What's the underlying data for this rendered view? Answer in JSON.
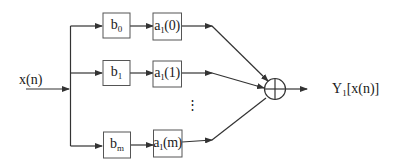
{
  "diagram": {
    "type": "block-diagram",
    "input": {
      "label": "x(n)"
    },
    "output": {
      "label_main": "Y",
      "label_sub": "1",
      "label_rest": "[x(n)]",
      "label": "Y1[x(n)]"
    },
    "branches": [
      {
        "b_main": "b",
        "b_sub": "0",
        "a_main": "a",
        "a_sub": "1",
        "a_arg": "(0)",
        "b_label": "b0",
        "a_label": "a1(0)"
      },
      {
        "b_main": "b",
        "b_sub": "1",
        "a_main": "a",
        "a_sub": "1",
        "a_arg": "(1)",
        "b_label": "b1",
        "a_label": "a1(1)"
      },
      {
        "b_main": "b",
        "b_sub": "m",
        "a_main": "a",
        "a_sub": "1",
        "a_arg": "(m)",
        "b_label": "bm",
        "a_label": "a1(m)"
      }
    ],
    "ellipsis": "⋮",
    "summing_node": {
      "symbol": "circle-plus"
    },
    "colors": {
      "stroke": "#333333",
      "box_border": "#555555",
      "text": "#1a1a1a"
    }
  }
}
